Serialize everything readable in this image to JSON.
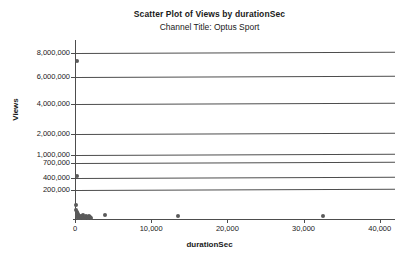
{
  "chart_data": {
    "type": "scatter",
    "title": "Scatter Plot of Views by durationSec",
    "subtitle": "Channel Title: Optus Sport",
    "xlabel": "durationSec",
    "ylabel": "Views",
    "grid": true,
    "legend": "none",
    "marker_color": "#5a5a5a",
    "axis_color": "#4d4d4d",
    "xlim": [
      0,
      42000
    ],
    "ylim": [
      0,
      8600000
    ],
    "x_ticks": [
      {
        "value": 0,
        "label": "0"
      },
      {
        "value": 10000,
        "label": "10,000"
      },
      {
        "value": 20000,
        "label": "20,000"
      },
      {
        "value": 30000,
        "label": "30,000"
      },
      {
        "value": 40000,
        "label": "40,000"
      }
    ],
    "y_ticks": [
      {
        "value": 8000000,
        "label": "8,000,000"
      },
      {
        "value": 6000000,
        "label": "6,000,000"
      },
      {
        "value": 4000000,
        "label": "4,000,000"
      },
      {
        "value": 2000000,
        "label": "2,000,000"
      },
      {
        "value": 1000000,
        "label": "1,000,000"
      },
      {
        "value": 700000,
        "label": "700,000"
      },
      {
        "value": 400000,
        "label": "400,000"
      },
      {
        "value": 200000,
        "label": "200,000"
      }
    ],
    "y_tick_pixels": [
      53,
      77,
      104,
      134,
      155,
      163,
      178,
      190
    ],
    "points": [
      {
        "x": 300,
        "y": 7300000
      },
      {
        "x": 300,
        "y": 450000
      },
      {
        "x": 150,
        "y": 95000
      },
      {
        "x": 180,
        "y": 60000
      },
      {
        "x": 200,
        "y": 45000
      },
      {
        "x": 220,
        "y": 38000
      },
      {
        "x": 250,
        "y": 30000
      },
      {
        "x": 270,
        "y": 25000
      },
      {
        "x": 300,
        "y": 20000
      },
      {
        "x": 330,
        "y": 16000
      },
      {
        "x": 360,
        "y": 12000
      },
      {
        "x": 400,
        "y": 10000
      },
      {
        "x": 450,
        "y": 34000
      },
      {
        "x": 500,
        "y": 22000
      },
      {
        "x": 560,
        "y": 14000
      },
      {
        "x": 620,
        "y": 9000
      },
      {
        "x": 700,
        "y": 8000
      },
      {
        "x": 800,
        "y": 18000
      },
      {
        "x": 900,
        "y": 12000
      },
      {
        "x": 1000,
        "y": 26000
      },
      {
        "x": 1100,
        "y": 10000
      },
      {
        "x": 1250,
        "y": 8000
      },
      {
        "x": 1400,
        "y": 24000
      },
      {
        "x": 1550,
        "y": 14000
      },
      {
        "x": 1700,
        "y": 9000
      },
      {
        "x": 1850,
        "y": 20000
      },
      {
        "x": 2000,
        "y": 11000
      },
      {
        "x": 2150,
        "y": 7000
      },
      {
        "x": 4000,
        "y": 30000
      },
      {
        "x": 13500,
        "y": 22000
      },
      {
        "x": 32500,
        "y": 20000
      }
    ]
  }
}
